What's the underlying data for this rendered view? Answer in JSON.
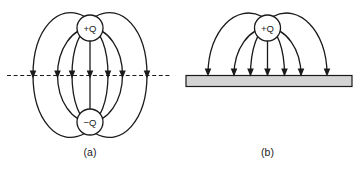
{
  "figure": {
    "background_color": "#ffffff",
    "line_color": "#1a1a1a",
    "conductor_fill_color": "#d4d4d4",
    "icons": {
      "arrowheads": "arrow-down-icon"
    }
  },
  "panel_a": {
    "label": "(a)",
    "top_charge_label": "+Q",
    "bottom_charge_label": "−Q"
  },
  "panel_b": {
    "label": "(b)",
    "charge_label": "+Q"
  }
}
